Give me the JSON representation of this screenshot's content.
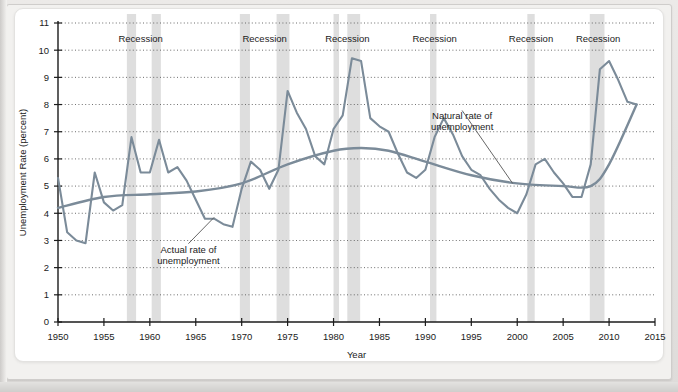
{
  "page": {
    "faint_header_text": ""
  },
  "chart_data": {
    "type": "line",
    "title": "",
    "xlabel": "Year",
    "ylabel": "Unemployment Rate (percent)",
    "xlim": [
      1950,
      2015
    ],
    "ylim": [
      0,
      11
    ],
    "xticks": [
      1950,
      1955,
      1960,
      1965,
      1970,
      1975,
      1980,
      1985,
      1990,
      1995,
      2000,
      2005,
      2010,
      2015
    ],
    "yticks": [
      0,
      1,
      2,
      3,
      4,
      5,
      6,
      7,
      8,
      9,
      10,
      11
    ],
    "grid": true,
    "grid_style": "dotted-horizontal",
    "legend": "none",
    "series": [
      {
        "name": "Actual rate of unemployment",
        "color": "#7b8b99",
        "x": [
          1950,
          1951,
          1952,
          1953,
          1954,
          1955,
          1956,
          1957,
          1958,
          1959,
          1960,
          1961,
          1962,
          1963,
          1964,
          1965,
          1966,
          1967,
          1968,
          1969,
          1970,
          1971,
          1972,
          1973,
          1974,
          1975,
          1976,
          1977,
          1978,
          1979,
          1980,
          1981,
          1982,
          1983,
          1984,
          1985,
          1986,
          1987,
          1988,
          1989,
          1990,
          1991,
          1992,
          1993,
          1994,
          1995,
          1996,
          1997,
          1998,
          1999,
          2000,
          2001,
          2002,
          2003,
          2004,
          2005,
          2006,
          2007,
          2008,
          2009,
          2010,
          2011,
          2012,
          2013
        ],
        "values": [
          5.3,
          3.3,
          3.0,
          2.9,
          5.5,
          4.4,
          4.1,
          4.3,
          6.8,
          5.5,
          5.5,
          6.7,
          5.5,
          5.7,
          5.2,
          4.5,
          3.8,
          3.8,
          3.6,
          3.5,
          4.9,
          5.9,
          5.6,
          4.9,
          5.6,
          8.5,
          7.7,
          7.1,
          6.1,
          5.8,
          7.1,
          7.6,
          9.7,
          9.6,
          7.5,
          7.2,
          7.0,
          6.2,
          5.5,
          5.3,
          5.6,
          6.8,
          7.5,
          6.9,
          6.1,
          5.6,
          5.4,
          4.9,
          4.5,
          4.2,
          4.0,
          4.7,
          5.8,
          6.0,
          5.5,
          5.1,
          4.6,
          4.6,
          5.8,
          9.3,
          9.6,
          8.9,
          8.1,
          8.0
        ]
      },
      {
        "name": "Natural rate of unemployment",
        "color": "#7b8b99",
        "x": [
          1950,
          1955,
          1960,
          1965,
          1970,
          1975,
          1980,
          1983,
          1986,
          1990,
          1995,
          2000,
          2005,
          2008,
          2010,
          2013
        ],
        "values": [
          4.2,
          4.6,
          4.7,
          4.8,
          5.1,
          5.8,
          6.3,
          6.4,
          6.3,
          5.9,
          5.4,
          5.1,
          5.0,
          5.0,
          5.8,
          8.0
        ]
      }
    ],
    "recessions": [
      {
        "label": "Recession",
        "start": 1957.5,
        "end": 1958.5
      },
      {
        "label": "Recession",
        "start": 1960.2,
        "end": 1961.2
      },
      {
        "label": "Recession",
        "start": 1969.8,
        "end": 1970.9
      },
      {
        "label": "Recession",
        "start": 1973.8,
        "end": 1975.2
      },
      {
        "label": "Recession",
        "start": 1980.0,
        "end": 1980.6
      },
      {
        "label": "Recession",
        "start": 1981.5,
        "end": 1982.9
      },
      {
        "label": "Recession",
        "start": 1990.5,
        "end": 1991.2
      },
      {
        "label": "Recession",
        "start": 2001.1,
        "end": 2001.9
      },
      {
        "label": "Recession",
        "start": 2007.9,
        "end": 2009.5
      }
    ],
    "recession_label_positions": [
      1959.0,
      1972.5,
      1981.5,
      1991.0,
      2001.5,
      2008.8
    ],
    "recession_label_text": "Recession",
    "annotations": [
      {
        "name": "actual-rate-annotation",
        "line1": "Actual rate of",
        "line2": "unemployment",
        "text_x": 1964.2,
        "text_y": 2.55,
        "anchor_x": 1967.0,
        "anchor_y": 3.85
      },
      {
        "name": "natural-rate-annotation",
        "line1": "Natural rate of",
        "line2": "unemployment",
        "text_x": 1994.0,
        "text_y": 7.45,
        "anchor_x": 1999.5,
        "anchor_y": 5.1
      }
    ],
    "colors": {
      "recession_band": "#d8d8d8",
      "line": "#7b8b99",
      "axis": "#1b1b1b",
      "grid": "#555555",
      "panel_background": "#ffffff"
    }
  }
}
